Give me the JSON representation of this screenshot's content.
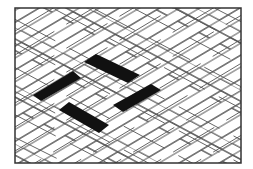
{
  "figure": {
    "frame": {
      "x": 15,
      "y": 8,
      "width": 226,
      "height": 155,
      "stroke": "#333333"
    },
    "colors": {
      "background": "#ffffff",
      "tile_fill": "#ffffff",
      "tile_stroke": "#555555",
      "highlight_fill": "#111111"
    },
    "highlighted_tiles": [
      {
        "name": "highlight-tile-left",
        "points": "33,95 73,71 81,78 41,101"
      },
      {
        "name": "highlight-tile-top",
        "points": "84,62 96,54 140,75 128,83"
      },
      {
        "name": "highlight-tile-bottom",
        "points": "59,110 69,102 109,125 99,133"
      },
      {
        "name": "highlight-tile-right",
        "points": "113,105 151,84 161,90 123,112"
      }
    ]
  }
}
